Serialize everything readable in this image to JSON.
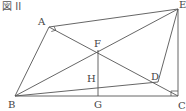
{
  "figure": {
    "title": "図 II",
    "line_color": "#555555",
    "points": {
      "A": {
        "label": "A",
        "x": 49,
        "y": 27
      },
      "E": {
        "label": "E",
        "x": 178,
        "y": 9
      },
      "B": {
        "label": "B",
        "x": 15,
        "y": 96
      },
      "C": {
        "label": "C",
        "x": 178,
        "y": 96
      },
      "F": {
        "label": "F",
        "x": 98,
        "y": 50
      },
      "G": {
        "label": "G",
        "x": 98,
        "y": 96
      },
      "H": {
        "label": "H",
        "x": 98,
        "y": 85
      },
      "D": {
        "label": "D",
        "x": 158,
        "y": 82
      }
    },
    "segments": [
      [
        "A",
        "E"
      ],
      [
        "A",
        "B"
      ],
      [
        "A",
        "C"
      ],
      [
        "B",
        "E"
      ],
      [
        "B",
        "D"
      ],
      [
        "E",
        "C"
      ],
      [
        "E",
        "D"
      ],
      [
        "F",
        "G"
      ],
      [
        "B",
        "C"
      ]
    ],
    "right_angles": [
      "A",
      "C"
    ]
  }
}
